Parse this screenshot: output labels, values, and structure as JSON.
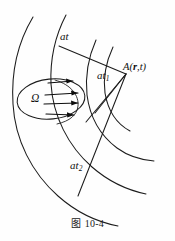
{
  "figure": {
    "caption": "图 10-4",
    "caption_prefix": "图",
    "caption_number": "10-4",
    "background_color": "#fefefe",
    "stroke_color": "#1c1c1c",
    "labels": {
      "at": "at",
      "at1_base": "at",
      "at1_subscript": "1",
      "at2_base": "at",
      "at2_subscript": "2",
      "omega": "Ω",
      "point_a_prefix": "A(",
      "point_a_vector": "r",
      "point_a_comma": ",",
      "point_a_time": "t",
      "point_a_suffix": ")"
    }
  },
  "diagram_data": {
    "type": "line-diagram",
    "description": "Wavefront propagation diagram: source region Omega with velocity arrows, expanding circular arcs at distances at, at1, at2 converging toward field point A(r,t)",
    "elements": [
      {
        "name": "outer-arc-left",
        "kind": "arc"
      },
      {
        "name": "inner-arc-left",
        "kind": "arc"
      },
      {
        "name": "outer-arc-right",
        "kind": "arc"
      },
      {
        "name": "inner-arc-right",
        "kind": "arc"
      },
      {
        "name": "source-region-ellipse",
        "kind": "ellipse",
        "label": "Ω"
      },
      {
        "name": "velocity-arrow-1",
        "kind": "arrow"
      },
      {
        "name": "velocity-arrow-2",
        "kind": "arrow"
      },
      {
        "name": "velocity-arrow-3",
        "kind": "arrow"
      },
      {
        "name": "velocity-arrow-4",
        "kind": "arrow"
      },
      {
        "name": "radius-line-at",
        "kind": "line",
        "label": "at"
      },
      {
        "name": "radius-line-at1",
        "kind": "line",
        "label": "at1"
      },
      {
        "name": "radius-line-at2",
        "kind": "line",
        "label": "at2"
      },
      {
        "name": "field-point-a",
        "kind": "point",
        "label": "A(r,t)"
      }
    ]
  }
}
